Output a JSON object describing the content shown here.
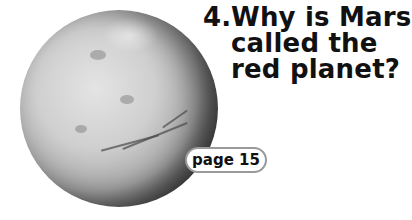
{
  "question": {
    "number": "4.",
    "lines": [
      "Why is Mars",
      "called the",
      "red planet?"
    ]
  },
  "page_ref": {
    "label": "page 15"
  },
  "image": {
    "subject": "planet-mars",
    "style": "grayscale"
  }
}
